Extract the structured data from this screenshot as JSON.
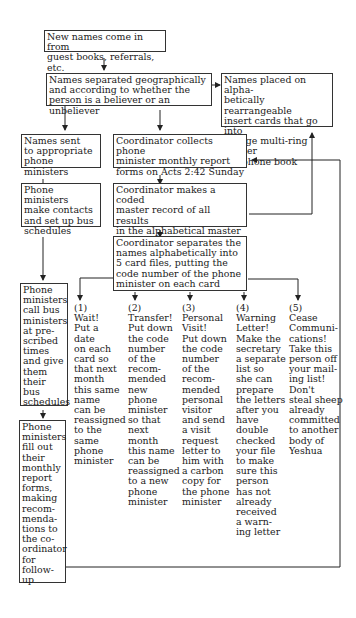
{
  "diagram": {
    "nodes": {
      "new_names": "New names come in from\nguest books, referrals, etc.",
      "separated": "Names separated geographically\nand according to whether the\nperson is a believer or an unbeliever",
      "insert_cards": "Names placed on alpha-\nbetically rearrangeable\ninsert cards that go into\na large multi-ring master\ntelephone book",
      "sent_to_phone": "Names sent\nto appropriate\nphone ministers",
      "coordinator_collects": "Coordinator collects phone\nminister monthly report\nforms on Acts 2:42 Sunday",
      "phone_contacts": "Phone ministers\nmake contacts\nand set up bus\nschedules",
      "coded_record": "Coordinator makes a coded\nmaster record of all results\nin the alphabetical master\ntelephone book",
      "separates_files": "Coordinator separates the\nnames alphabetically into\n5 card files, putting the\ncode number of the phone\nminister on each card",
      "call_bus": "Phone\nministers\ncall bus\nministers\nat pre-\nscribed\ntimes\nand give\nthem\ntheir bus\nschedules",
      "fill_out": "Phone\nministers\nfill out\ntheir\nmonthly\nreport\nforms,\nmaking\nrecom-\nmenda-\ntions to\nthe co-\nordinator\nfor\nfollow-\nup"
    },
    "options": [
      "(1)\nWait!\nPut a\ndate\non each\ncard so\nthat next\nmonth\nthis same\nname\ncan be\nreassigned\nto the\nsame\nphone\nminister",
      "(2)\nTransfer!\nPut down\nthe code\nnumber\nof the\nrecom-\nmended\nnew\nphone\nminister\nso that\nnext\nmonth\nthis name\ncan be\nreassigned\nto a new\nphone\nminister",
      "(3)\nPersonal\nVisit!\nPut down\nthe code\nnumber\nof the\nrecom-\nmended\npersonal\nvisitor\nand send\na visit\nrequest\nletter to\nhim with\na carbon\ncopy for\nthe phone\nminister",
      "(4)\nWarning\nLetter!\nMake the\nsecretary\na separate\nlist so\nshe can\nprepare\nthe letters\nafter you\nhave\ndouble\nchecked\nyour file\nto make\nsure this\nperson\nhas not\nalready\nreceived\na warn-\ning letter",
      "(5)\nCease\nCommuni-\ncations!\nTake this\nperson off\nyour mail-\ning list!\nDon't\nsteal sheep\nalready\ncommitted\nto another\nbody of\nYeshua"
    ]
  }
}
